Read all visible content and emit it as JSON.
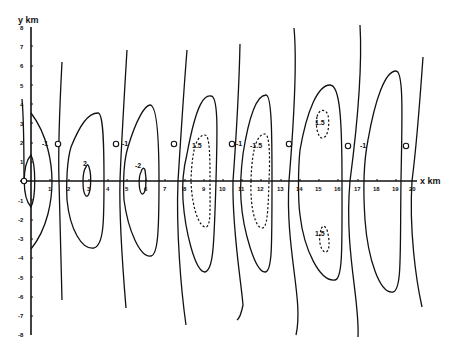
{
  "figure": {
    "type": "contour_diagram",
    "x_axis": {
      "label": "x km",
      "min": 0,
      "max": 20,
      "ticks": [
        "1",
        "2",
        "3",
        "4",
        "5",
        "6",
        "7",
        "8",
        "9",
        "10",
        "11",
        "12",
        "13",
        "14",
        "15",
        "16",
        "17",
        "18",
        "19",
        "20"
      ]
    },
    "y_axis": {
      "label": "y km",
      "min": -8,
      "max": 8,
      "ticks": [
        "8",
        "7",
        "6",
        "5",
        "4",
        "3",
        "2",
        "1",
        "-1",
        "-2",
        "-3",
        "-4",
        "-5",
        "-6",
        "-7",
        "-8"
      ]
    },
    "contour_labels": [
      {
        "text": "2",
        "x": 2.9,
        "y": 0.8
      },
      {
        "text": "-2",
        "x": 5.8,
        "y": 0.8
      },
      {
        "text": "1.5",
        "x": 8.6,
        "y": 1.5
      },
      {
        "text": "-1.5",
        "x": 11.6,
        "y": 1.5
      },
      {
        "text": "1.5",
        "x": 15.2,
        "y": 4.0
      },
      {
        "text": "1.5",
        "x": 15.1,
        "y": -3.2
      },
      {
        "text": "-1",
        "x": 1.7,
        "y": 1.8
      },
      {
        "text": "-1",
        "x": 4.8,
        "y": 1.8
      },
      {
        "text": "-1",
        "x": 10.6,
        "y": 1.8
      },
      {
        "text": "-1",
        "x": 16.8,
        "y": 1.8
      }
    ],
    "node_markers": [
      {
        "x": 0,
        "y": 0
      },
      {
        "x": 1.5,
        "y": 1.9
      },
      {
        "x": 4.5,
        "y": 1.9
      },
      {
        "x": 7.5,
        "y": 1.9
      },
      {
        "x": 10.4,
        "y": 1.9
      },
      {
        "x": 13.4,
        "y": 1.9
      },
      {
        "x": 16.4,
        "y": 1.9
      },
      {
        "x": 19.4,
        "y": 1.9
      }
    ]
  }
}
